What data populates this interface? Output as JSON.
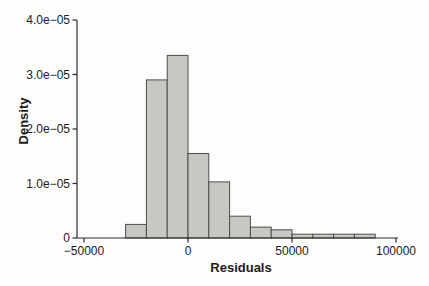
{
  "chart_data": {
    "type": "bar",
    "variant": "histogram",
    "title": "",
    "xlabel": "Residuals",
    "ylabel": "Density",
    "bin_edges": [
      -30000,
      -20000,
      -10000,
      0,
      10000,
      20000,
      30000,
      40000,
      50000,
      60000,
      70000,
      80000,
      90000
    ],
    "densities": [
      2.5e-06,
      2.9e-05,
      3.35e-05,
      1.55e-05,
      1.03e-05,
      4e-06,
      2e-06,
      1.5e-06,
      7e-07,
      7e-07,
      7e-07,
      7e-07
    ],
    "x_ticks": [
      -50000,
      0,
      50000,
      100000
    ],
    "x_tick_labels": [
      "−50000",
      "0",
      "50000",
      "100000"
    ],
    "y_ticks": [
      0,
      1e-05,
      2e-05,
      3e-05,
      4e-05
    ],
    "y_tick_labels": [
      "0",
      "1.0e−05",
      "2.0e−05",
      "3.0e−05",
      "4.0e−05"
    ],
    "xlim": [
      -55000,
      103000
    ],
    "ylim": [
      0,
      4e-05
    ],
    "grid": false,
    "legend": null,
    "colors": {
      "bar_fill": "#c8c7c3",
      "bar_border": "#4d4d4d",
      "axis": "#2b2b2b",
      "text": "#1b1b1b",
      "background": "#fdfdfb"
    }
  }
}
